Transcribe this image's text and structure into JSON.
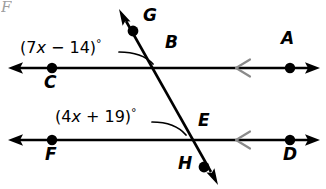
{
  "figure": {
    "kind": "geometry-diagram",
    "width": 326,
    "height": 189,
    "background_color": "#ffffff",
    "line_color": "#000000",
    "tick_color": "#8a8a8a",
    "arc_color": "#000000"
  },
  "labels": {
    "point_a": "A",
    "point_b": "B",
    "point_c": "C",
    "point_d": "D",
    "point_e": "E",
    "point_f": "F",
    "point_g": "G",
    "point_h": "H",
    "corner_artifact": "F"
  },
  "angle_expressions": {
    "upper": {
      "open_paren": "(",
      "coefficient": "7",
      "variable": "x",
      "operator": "−",
      "constant": "14",
      "close_paren": ")",
      "degree": "°",
      "full": "(7x − 14)°"
    },
    "lower": {
      "open_paren": "(",
      "coefficient": "4",
      "variable": "x",
      "operator": "+",
      "constant": "19",
      "close_paren": ")",
      "degree": "°",
      "full": "(4x + 19)°"
    }
  },
  "geometry": {
    "upper_line": {
      "name": "line-CA",
      "y": 68,
      "x_start": 8,
      "x_end": 320,
      "left_arrow": true,
      "right_arrow": true,
      "parallel_tick_x": 243,
      "points": [
        {
          "label": "C",
          "x": 52,
          "y": 68
        },
        {
          "label": "B",
          "x": 160,
          "y": 68
        },
        {
          "label": "A",
          "x": 290,
          "y": 68
        }
      ]
    },
    "lower_line": {
      "name": "line-FD",
      "y": 140,
      "x_start": 8,
      "x_end": 320,
      "left_arrow": true,
      "right_arrow": true,
      "parallel_tick_x": 243,
      "points": [
        {
          "label": "F",
          "x": 52,
          "y": 140
        },
        {
          "label": "E",
          "x": 193,
          "y": 140
        },
        {
          "label": "D",
          "x": 290,
          "y": 140
        }
      ]
    },
    "transversal": {
      "name": "line-GH",
      "x1": 119,
      "y1": 9,
      "x2": 217,
      "y2": 184,
      "top_arrow": true,
      "bottom_arrow": true,
      "points": [
        {
          "label": "G",
          "x": 133,
          "y": 31
        },
        {
          "label": "H",
          "x": 204,
          "y": 167
        }
      ]
    },
    "arcs": [
      {
        "name": "upper-angle-arc",
        "from_x": 120,
        "from_y": 52,
        "to_x": 153,
        "to_y": 63
      },
      {
        "name": "lower-angle-arc",
        "from_x": 153,
        "from_y": 122,
        "to_x": 186,
        "to_y": 134
      }
    ]
  },
  "label_positions": {
    "A": {
      "x": 281,
      "y": 38
    },
    "B": {
      "x": 165,
      "y": 42
    },
    "C": {
      "x": 44,
      "y": 75
    },
    "D": {
      "x": 283,
      "y": 147
    },
    "E": {
      "x": 198,
      "y": 113
    },
    "F": {
      "x": 45,
      "y": 147
    },
    "G": {
      "x": 143,
      "y": 8
    },
    "H": {
      "x": 178,
      "y": 158
    },
    "upper_expr": {
      "x": 20,
      "y": 38
    },
    "lower_expr": {
      "x": 55,
      "y": 107
    }
  }
}
